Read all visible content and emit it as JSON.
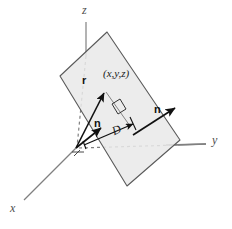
{
  "figure": {
    "background_color": "#ffffff"
  },
  "colors": {
    "axis": "#808080",
    "plane_fill": "#e9e9e9",
    "plane_edge": "#5a5a5a",
    "vector": "#111111",
    "label": "#1a1a1a",
    "axis_label": "#4d4d4d"
  },
  "axes": {
    "x_label": "x",
    "y_label": "y",
    "z_label": "z",
    "origin": {
      "x": 76,
      "y": 148
    }
  },
  "labels": {
    "point": "(x,y,z)",
    "position_vector": "r",
    "normal_vector_plane": "n",
    "normal_vector_origin": "n",
    "distance": "D"
  },
  "elements": {
    "plane_name": "tilted-plane",
    "right_angle_marker": "right-angle-marker",
    "point_marker": "point-xyz"
  }
}
